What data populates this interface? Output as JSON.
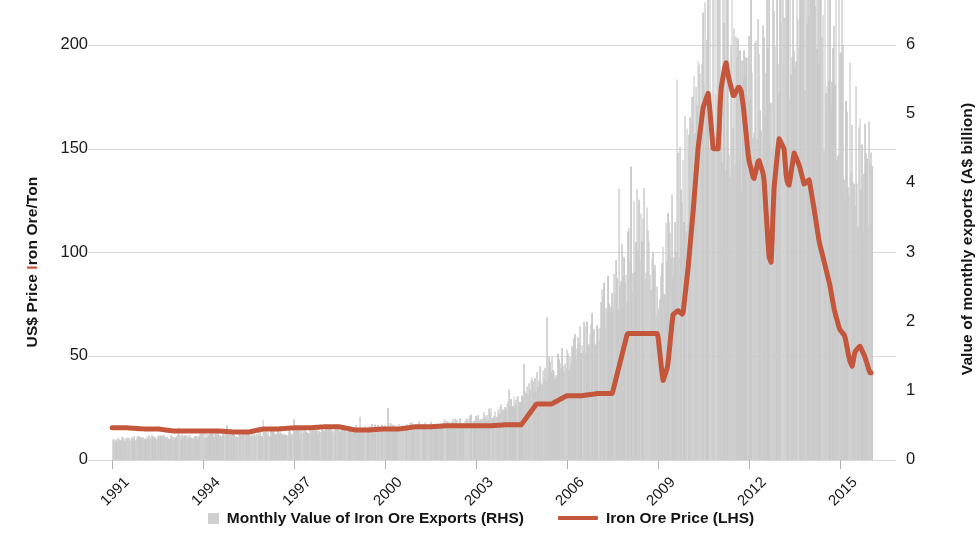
{
  "chart_data": {
    "type": "bar",
    "title": "",
    "subtitle": "",
    "xlabel": "",
    "ylabel": "US$ Price Iron Ore/Ton",
    "ylabel_right": "Value of monthly exports (A$ billion)",
    "grid": true,
    "legend_position": "bottom",
    "x_axis": {
      "tick_labels": [
        "1991",
        "1994",
        "1997",
        "2000",
        "2003",
        "2006",
        "2009",
        "2012",
        "2015"
      ],
      "tick_values": [
        1991,
        1994,
        1997,
        2000,
        2003,
        2006,
        2009,
        2012,
        2015
      ],
      "xlim": [
        1990.6,
        2016.4
      ],
      "rotation": -45
    },
    "y_axis_left": {
      "tick_labels": [
        "0",
        "50",
        "100",
        "150",
        "200"
      ],
      "tick_values": [
        0,
        50,
        100,
        150,
        200
      ],
      "ylim": [
        0,
        208
      ],
      "units": "US$ per Ton"
    },
    "y_axis_right": {
      "tick_labels": [
        "0",
        "1",
        "2",
        "3",
        "4",
        "5",
        "6",
        "7"
      ],
      "tick_values": [
        0,
        1,
        2,
        3,
        4,
        5,
        6,
        7
      ],
      "ylim": [
        0,
        7.28
      ],
      "units": "A$ billion"
    },
    "series": [
      {
        "name": "Monthly Value of Iron Ore Exports (RHS)",
        "type": "bar",
        "axis": "right",
        "color": "#c9c9c9",
        "x": [
          1991.0,
          1991.25,
          1991.5,
          1991.75,
          1992.0,
          1992.25,
          1992.5,
          1992.75,
          1993.0,
          1993.25,
          1993.5,
          1993.75,
          1994.0,
          1994.25,
          1994.5,
          1994.75,
          1995.0,
          1995.25,
          1995.5,
          1995.75,
          1996.0,
          1996.25,
          1996.5,
          1996.75,
          1997.0,
          1997.25,
          1997.5,
          1997.75,
          1998.0,
          1998.25,
          1998.5,
          1998.75,
          1999.0,
          1999.25,
          1999.5,
          1999.75,
          2000.0,
          2000.25,
          2000.5,
          2000.75,
          2001.0,
          2001.25,
          2001.5,
          2001.75,
          2002.0,
          2002.25,
          2002.5,
          2002.75,
          2003.0,
          2003.25,
          2003.5,
          2003.75,
          2004.0,
          2004.25,
          2004.5,
          2004.75,
          2005.0,
          2005.25,
          2005.5,
          2005.75,
          2006.0,
          2006.25,
          2006.5,
          2006.75,
          2007.0,
          2007.25,
          2007.5,
          2007.75,
          2008.0,
          2008.25,
          2008.5,
          2008.75,
          2009.0,
          2009.25,
          2009.5,
          2009.75,
          2010.0,
          2010.25,
          2010.5,
          2010.75,
          2011.0,
          2011.25,
          2011.5,
          2011.75,
          2012.0,
          2012.25,
          2012.5,
          2012.75,
          2013.0,
          2013.25,
          2013.5,
          2013.75,
          2014.0,
          2014.25,
          2014.5,
          2014.75,
          2015.0,
          2015.25,
          2015.5,
          2015.75,
          2016.0
        ],
        "values": [
          0.28,
          0.3,
          0.29,
          0.31,
          0.3,
          0.32,
          0.31,
          0.33,
          0.32,
          0.33,
          0.34,
          0.33,
          0.35,
          0.34,
          0.36,
          0.35,
          0.37,
          0.36,
          0.38,
          0.37,
          0.39,
          0.38,
          0.4,
          0.39,
          0.41,
          0.4,
          0.42,
          0.41,
          0.43,
          0.42,
          0.44,
          0.43,
          0.45,
          0.44,
          0.46,
          0.45,
          0.47,
          0.46,
          0.48,
          0.47,
          0.49,
          0.5,
          0.49,
          0.51,
          0.52,
          0.53,
          0.55,
          0.57,
          0.6,
          0.63,
          0.66,
          0.7,
          0.75,
          0.82,
          0.9,
          1.0,
          1.12,
          1.22,
          1.3,
          1.38,
          1.48,
          1.6,
          1.72,
          1.85,
          2.0,
          2.15,
          2.3,
          2.5,
          2.8,
          3.1,
          3.3,
          2.6,
          2.4,
          2.8,
          3.3,
          3.8,
          4.3,
          4.7,
          5.0,
          5.3,
          5.6,
          5.5,
          5.2,
          4.9,
          4.7,
          4.9,
          5.2,
          5.6,
          6.1,
          6.5,
          6.8,
          7.2,
          6.6,
          6.2,
          5.8,
          5.4,
          5.0,
          4.6,
          4.3,
          4.1,
          4.0
        ],
        "peak_value": 7.2,
        "peak_x": 2013.75
      },
      {
        "name": "Iron Ore Price (LHS)",
        "type": "line",
        "axis": "left",
        "color": "#c4563c",
        "line_width": 5,
        "x": [
          1991.0,
          1991.5,
          1992.0,
          1992.5,
          1993.0,
          1993.5,
          1994.0,
          1994.5,
          1995.0,
          1995.5,
          1996.0,
          1996.5,
          1997.0,
          1997.5,
          1998.0,
          1998.5,
          1999.0,
          1999.5,
          2000.0,
          2000.5,
          2001.0,
          2001.5,
          2002.0,
          2002.5,
          2003.0,
          2003.5,
          2004.0,
          2004.5,
          2005.0,
          2005.5,
          2006.0,
          2006.5,
          2007.0,
          2007.5,
          2008.0,
          2008.25,
          2008.5,
          2008.75,
          2009.0,
          2009.17,
          2009.33,
          2009.5,
          2009.67,
          2009.83,
          2010.0,
          2010.17,
          2010.33,
          2010.5,
          2010.67,
          2010.83,
          2011.0,
          2011.08,
          2011.17,
          2011.25,
          2011.33,
          2011.5,
          2011.67,
          2011.75,
          2011.83,
          2012.0,
          2012.17,
          2012.33,
          2012.5,
          2012.67,
          2012.75,
          2012.83,
          2013.0,
          2013.17,
          2013.25,
          2013.33,
          2013.5,
          2013.67,
          2013.83,
          2014.0,
          2014.17,
          2014.33,
          2014.5,
          2014.67,
          2014.83,
          2015.0,
          2015.17,
          2015.33,
          2015.42,
          2015.5,
          2015.67,
          2015.83,
          2016.0
        ],
        "values": [
          15.5,
          15.5,
          15.0,
          15.0,
          14.0,
          14.0,
          14.0,
          14.0,
          13.5,
          13.5,
          15.0,
          15.0,
          15.5,
          15.5,
          16.0,
          16.0,
          14.5,
          14.5,
          15.0,
          15.0,
          16.0,
          16.0,
          16.5,
          16.5,
          16.5,
          16.5,
          17.0,
          17.0,
          27.0,
          27.0,
          31.0,
          31.0,
          32.0,
          32.0,
          61.0,
          61.0,
          61.0,
          61.0,
          61.0,
          38.0,
          45.0,
          70.0,
          72.0,
          70.0,
          92.0,
          120.0,
          150.0,
          170.0,
          177.0,
          150.0,
          150.0,
          178.0,
          186.0,
          192.0,
          185.0,
          175.0,
          180.0,
          178.0,
          170.0,
          145.0,
          135.0,
          145.0,
          137.0,
          98.0,
          95.0,
          130.0,
          155.0,
          150.0,
          135.0,
          132.0,
          148.0,
          142.0,
          133.0,
          135.0,
          120.0,
          105.0,
          95.0,
          85.0,
          72.0,
          63.0,
          60.0,
          48.0,
          45.0,
          52.0,
          55.0,
          50.0,
          42.0
        ],
        "peak_value": 192,
        "peak_x": 2011.25,
        "end_value": 42
      }
    ],
    "legend": [
      {
        "label": "Monthly Value of Iron Ore Exports (RHS)",
        "marker": "square",
        "color": "#cfcfcf"
      },
      {
        "label": "Iron Ore Price (LHS)",
        "marker": "line",
        "color": "#c4563c"
      }
    ]
  },
  "axes": {
    "left_title_prefix": "US$ Price ",
    "left_title_i": "I",
    "left_title_suffix": "ron Ore/Ton",
    "right_title": "Value of monthly exports (A$ billion)"
  },
  "colors": {
    "line": "#c4563c",
    "bars": "#c9c9c9",
    "grid": "#d8d8d8",
    "text": "#1a1a1a",
    "background": "#ffffff"
  }
}
